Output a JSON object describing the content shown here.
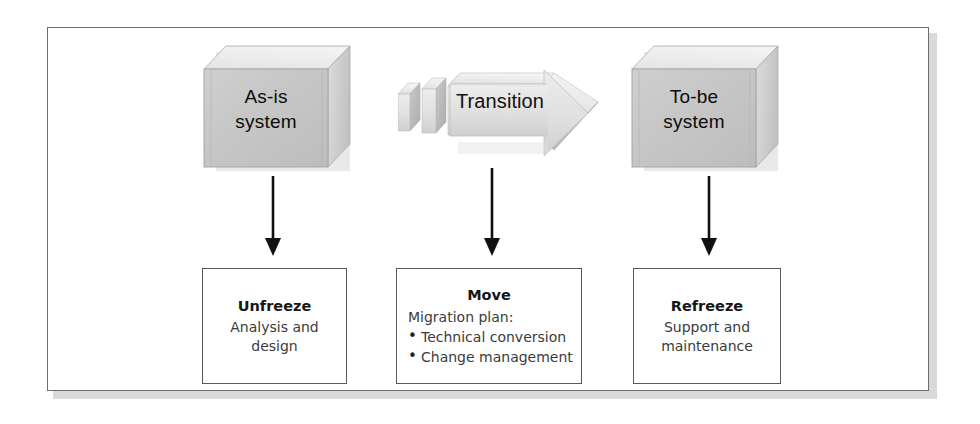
{
  "diagram": {
    "frame": {
      "border_color": "#6e6e72",
      "shadow_color": "#d9d9d9",
      "background": "#ffffff"
    },
    "systems": [
      {
        "id": "as-is",
        "label_line_1": "As-is",
        "label_line_2": "system",
        "face_color": "#c6c6c6",
        "top_color": "#e8e8e8",
        "side_color": "#d4d4d4"
      },
      {
        "id": "to-be",
        "label_line_1": "To-be",
        "label_line_2": "system",
        "face_color": "#c6c6c6",
        "top_color": "#e8e8e8",
        "side_color": "#d4d4d4"
      }
    ],
    "transition": {
      "label": "Transition",
      "body_color": "#e2e2e2",
      "shade_color": "#b9b9b9",
      "segment_count": 3
    },
    "connectors": [
      {
        "id": "arrow-as-is-to-unfreeze",
        "direction": "down",
        "color": "#111111"
      },
      {
        "id": "arrow-transition-to-move",
        "direction": "down",
        "color": "#111111"
      },
      {
        "id": "arrow-to-be-to-refreeze",
        "direction": "down",
        "color": "#111111"
      }
    ],
    "stages": [
      {
        "id": "unfreeze",
        "title": "Unfreeze",
        "lines": [
          "Analysis and",
          "design"
        ],
        "bullets": []
      },
      {
        "id": "move",
        "title": "Move",
        "lines": [
          "Migration plan:"
        ],
        "bullets": [
          "Technical conversion",
          "Change management"
        ]
      },
      {
        "id": "refreeze",
        "title": "Refreeze",
        "lines": [
          "Support and",
          "maintenance"
        ],
        "bullets": []
      }
    ]
  }
}
